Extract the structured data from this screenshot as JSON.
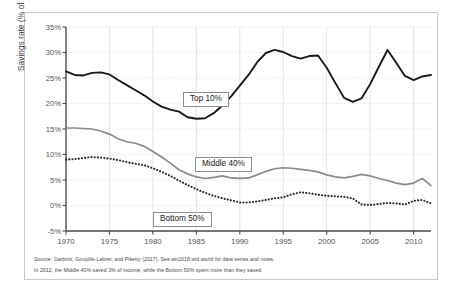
{
  "figure": {
    "notes": [
      "Source: Garbinti, Goupille-Lebret, and Piketty (2017). See wir2018.wid.world for data series and notes.",
      "In 2012, the Middle 40% saved 3% of income, while the Bottom 50% spent more than they saved."
    ]
  },
  "chart_data": {
    "type": "line",
    "title": "",
    "xlabel": "",
    "ylabel": "Savings rate (% of income)",
    "xlim": [
      1970,
      2012
    ],
    "ylim": [
      -5,
      35
    ],
    "ytick_labels": [
      "35%",
      "30%",
      "25%",
      "20%",
      "15%",
      "10%",
      "5%",
      "0%",
      "-5%"
    ],
    "ytick_values": [
      35,
      30,
      25,
      20,
      15,
      10,
      5,
      0,
      -5
    ],
    "xtick_labels": [
      "1970",
      "1975",
      "1980",
      "1985",
      "1990",
      "1995",
      "2000",
      "2005",
      "2010"
    ],
    "xtick_values": [
      1970,
      1975,
      1980,
      1985,
      1990,
      1995,
      2000,
      2005,
      2010
    ],
    "grid": true,
    "legend_position": "inline-annotations",
    "x": [
      1970,
      1971,
      1972,
      1973,
      1974,
      1975,
      1976,
      1977,
      1978,
      1979,
      1980,
      1981,
      1982,
      1983,
      1984,
      1985,
      1986,
      1987,
      1988,
      1989,
      1990,
      1991,
      1992,
      1993,
      1994,
      1995,
      1996,
      1997,
      1998,
      1999,
      2000,
      2001,
      2002,
      2003,
      2004,
      2005,
      2006,
      2007,
      2008,
      2009,
      2010,
      2011,
      2012
    ],
    "series": [
      {
        "name": "Top 10%",
        "color": "#1a1a1a",
        "style": "solid",
        "label_text": "Top 10%",
        "values": [
          26.3,
          25.6,
          25.5,
          26.0,
          26.1,
          25.7,
          24.6,
          23.6,
          22.6,
          21.6,
          20.4,
          19.4,
          18.8,
          18.4,
          17.3,
          17.0,
          17.1,
          18.1,
          19.6,
          21.4,
          23.5,
          25.6,
          28.1,
          29.9,
          30.5,
          30.1,
          29.3,
          28.8,
          29.3,
          29.4,
          27.0,
          24.0,
          21.1,
          20.3,
          21.0,
          23.8,
          27.2,
          30.5,
          28.0,
          25.4,
          24.6,
          25.3,
          25.6
        ]
      },
      {
        "name": "Middle 40%",
        "color": "#8c8c8c",
        "style": "solid",
        "label_text": "Middle 40%",
        "values": [
          15.2,
          15.2,
          15.1,
          15.0,
          14.6,
          14.0,
          13.1,
          12.5,
          12.2,
          11.6,
          10.6,
          9.5,
          8.3,
          7.0,
          6.2,
          5.6,
          5.3,
          5.5,
          5.8,
          5.4,
          5.3,
          5.4,
          6.0,
          6.7,
          7.2,
          7.4,
          7.3,
          7.1,
          6.9,
          6.6,
          6.0,
          5.6,
          5.4,
          5.7,
          6.1,
          5.8,
          5.3,
          4.9,
          4.4,
          4.1,
          4.4,
          5.3,
          3.9
        ]
      },
      {
        "name": "Bottom 50%",
        "color": "#2a2a2a",
        "style": "dotted",
        "label_text": "Bottom 50%",
        "values": [
          9.0,
          9.1,
          9.3,
          9.5,
          9.4,
          9.2,
          8.9,
          8.5,
          8.2,
          7.9,
          7.3,
          6.6,
          5.8,
          4.9,
          4.0,
          3.2,
          2.5,
          1.9,
          1.4,
          1.0,
          0.6,
          0.6,
          0.8,
          1.1,
          1.4,
          1.6,
          2.2,
          2.6,
          2.4,
          2.1,
          1.9,
          1.8,
          1.7,
          1.4,
          0.2,
          0.1,
          0.3,
          0.5,
          0.4,
          0.2,
          0.9,
          1.1,
          0.4
        ]
      }
    ]
  }
}
